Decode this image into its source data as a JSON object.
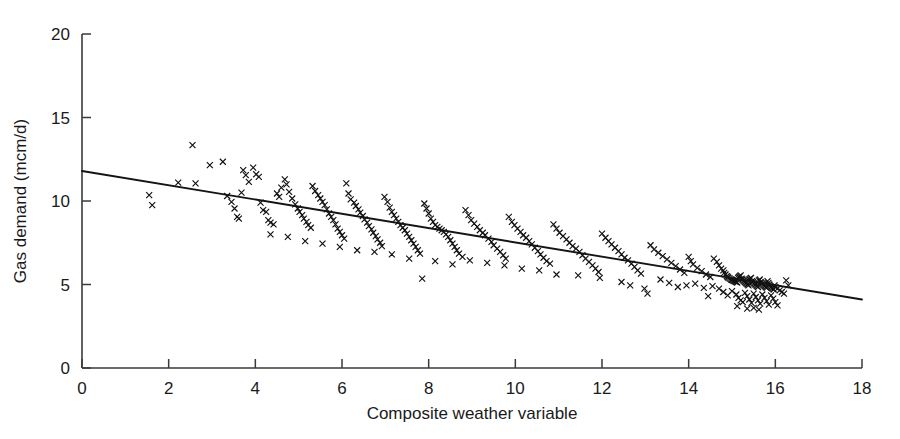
{
  "chart_data": {
    "type": "scatter",
    "title": "",
    "xlabel": "Composite weather variable",
    "ylabel": "Gas demand (mcm/d)",
    "xlim": [
      0,
      18
    ],
    "ylim": [
      0,
      20
    ],
    "xticks": [
      0,
      2,
      4,
      6,
      8,
      10,
      12,
      14,
      16,
      18
    ],
    "yticks": [
      0,
      5,
      10,
      15,
      20
    ],
    "xticklabels": [
      "0",
      "2",
      "4",
      "6",
      "8",
      "10",
      "12",
      "14",
      "16",
      "18"
    ],
    "yticklabels": [
      "0",
      "5",
      "10",
      "15",
      "20"
    ],
    "grid": false,
    "legend": null,
    "marker": "x",
    "marker_color": "#111111",
    "series": [
      {
        "name": "Observations",
        "type": "scatter",
        "points": [
          [
            1.55,
            10.35
          ],
          [
            1.62,
            9.75
          ],
          [
            2.22,
            11.1
          ],
          [
            2.55,
            13.35
          ],
          [
            2.62,
            11.05
          ],
          [
            2.95,
            12.15
          ],
          [
            3.25,
            12.35
          ],
          [
            3.35,
            10.3
          ],
          [
            3.45,
            9.95
          ],
          [
            3.52,
            9.55
          ],
          [
            3.58,
            9.05
          ],
          [
            3.62,
            8.95
          ],
          [
            3.68,
            10.5
          ],
          [
            3.72,
            11.85
          ],
          [
            3.78,
            11.55
          ],
          [
            3.85,
            11.15
          ],
          [
            3.95,
            12.0
          ],
          [
            4.02,
            11.6
          ],
          [
            4.08,
            11.45
          ],
          [
            4.12,
            9.9
          ],
          [
            4.18,
            9.45
          ],
          [
            4.25,
            9.35
          ],
          [
            4.3,
            8.85
          ],
          [
            4.35,
            8.7
          ],
          [
            4.42,
            8.6
          ],
          [
            4.5,
            10.45
          ],
          [
            4.55,
            10.25
          ],
          [
            4.6,
            10.8
          ],
          [
            4.68,
            11.3
          ],
          [
            4.72,
            11.0
          ],
          [
            4.78,
            10.55
          ],
          [
            4.85,
            10.15
          ],
          [
            4.92,
            9.8
          ],
          [
            4.98,
            9.55
          ],
          [
            5.02,
            9.35
          ],
          [
            5.08,
            9.15
          ],
          [
            5.12,
            8.95
          ],
          [
            5.18,
            8.75
          ],
          [
            5.22,
            8.55
          ],
          [
            5.28,
            8.4
          ],
          [
            5.32,
            10.9
          ],
          [
            5.38,
            10.6
          ],
          [
            5.45,
            10.35
          ],
          [
            5.5,
            10.15
          ],
          [
            5.55,
            9.95
          ],
          [
            5.6,
            9.75
          ],
          [
            5.65,
            9.5
          ],
          [
            5.7,
            9.25
          ],
          [
            5.75,
            9.05
          ],
          [
            5.8,
            8.85
          ],
          [
            5.85,
            8.6
          ],
          [
            5.9,
            8.35
          ],
          [
            5.95,
            8.15
          ],
          [
            6.0,
            7.95
          ],
          [
            6.05,
            7.75
          ],
          [
            6.1,
            11.05
          ],
          [
            6.15,
            10.45
          ],
          [
            6.2,
            10.1
          ],
          [
            6.28,
            9.9
          ],
          [
            6.32,
            9.7
          ],
          [
            6.38,
            9.5
          ],
          [
            6.42,
            9.3
          ],
          [
            6.48,
            9.1
          ],
          [
            6.52,
            8.9
          ],
          [
            6.58,
            8.7
          ],
          [
            6.62,
            8.5
          ],
          [
            6.68,
            8.3
          ],
          [
            6.72,
            8.1
          ],
          [
            6.78,
            7.9
          ],
          [
            6.82,
            7.7
          ],
          [
            6.88,
            7.5
          ],
          [
            6.92,
            7.3
          ],
          [
            6.98,
            10.25
          ],
          [
            7.05,
            9.95
          ],
          [
            7.1,
            9.6
          ],
          [
            7.15,
            9.35
          ],
          [
            7.2,
            9.15
          ],
          [
            7.25,
            8.95
          ],
          [
            7.3,
            8.75
          ],
          [
            7.35,
            8.55
          ],
          [
            7.4,
            8.4
          ],
          [
            7.45,
            8.25
          ],
          [
            7.5,
            8.05
          ],
          [
            7.55,
            7.85
          ],
          [
            7.6,
            7.65
          ],
          [
            7.65,
            7.45
          ],
          [
            7.7,
            7.25
          ],
          [
            7.75,
            7.05
          ],
          [
            7.8,
            6.85
          ],
          [
            7.85,
            5.35
          ],
          [
            7.9,
            9.85
          ],
          [
            7.95,
            9.55
          ],
          [
            8.0,
            9.25
          ],
          [
            8.05,
            8.95
          ],
          [
            8.1,
            8.75
          ],
          [
            8.15,
            8.55
          ],
          [
            8.2,
            8.45
          ],
          [
            8.25,
            8.35
          ],
          [
            8.3,
            8.25
          ],
          [
            8.35,
            8.15
          ],
          [
            8.4,
            8.0
          ],
          [
            8.45,
            7.85
          ],
          [
            8.5,
            7.65
          ],
          [
            8.55,
            7.45
          ],
          [
            8.6,
            7.25
          ],
          [
            8.65,
            7.05
          ],
          [
            8.7,
            6.85
          ],
          [
            8.78,
            6.65
          ],
          [
            8.85,
            9.45
          ],
          [
            8.92,
            9.15
          ],
          [
            8.98,
            8.85
          ],
          [
            9.05,
            8.65
          ],
          [
            9.12,
            8.45
          ],
          [
            9.18,
            8.25
          ],
          [
            9.25,
            8.1
          ],
          [
            9.3,
            7.95
          ],
          [
            9.38,
            7.75
          ],
          [
            9.45,
            7.55
          ],
          [
            9.5,
            7.35
          ],
          [
            9.58,
            7.15
          ],
          [
            9.65,
            6.95
          ],
          [
            9.72,
            6.75
          ],
          [
            9.78,
            6.55
          ],
          [
            9.85,
            9.05
          ],
          [
            9.92,
            8.75
          ],
          [
            9.98,
            8.55
          ],
          [
            10.05,
            8.35
          ],
          [
            10.12,
            8.15
          ],
          [
            10.18,
            7.95
          ],
          [
            10.25,
            7.8
          ],
          [
            10.32,
            7.6
          ],
          [
            10.38,
            7.4
          ],
          [
            10.45,
            7.2
          ],
          [
            10.52,
            7.0
          ],
          [
            10.58,
            6.8
          ],
          [
            10.65,
            6.6
          ],
          [
            10.72,
            6.4
          ],
          [
            10.8,
            6.25
          ],
          [
            10.88,
            8.6
          ],
          [
            10.95,
            8.35
          ],
          [
            11.02,
            8.1
          ],
          [
            11.1,
            7.9
          ],
          [
            11.18,
            7.7
          ],
          [
            11.25,
            7.5
          ],
          [
            11.32,
            7.3
          ],
          [
            11.4,
            7.15
          ],
          [
            11.48,
            6.95
          ],
          [
            11.55,
            6.75
          ],
          [
            11.62,
            6.55
          ],
          [
            11.7,
            6.35
          ],
          [
            11.78,
            6.15
          ],
          [
            11.85,
            5.95
          ],
          [
            11.92,
            5.75
          ],
          [
            12.0,
            8.05
          ],
          [
            12.08,
            7.8
          ],
          [
            12.15,
            7.6
          ],
          [
            12.22,
            7.4
          ],
          [
            12.3,
            7.2
          ],
          [
            12.38,
            7.0
          ],
          [
            12.45,
            6.8
          ],
          [
            12.52,
            6.6
          ],
          [
            12.6,
            6.45
          ],
          [
            12.68,
            6.25
          ],
          [
            12.75,
            6.05
          ],
          [
            12.82,
            5.85
          ],
          [
            12.9,
            5.65
          ],
          [
            12.98,
            4.75
          ],
          [
            13.05,
            4.45
          ],
          [
            13.12,
            7.35
          ],
          [
            13.2,
            7.1
          ],
          [
            13.3,
            6.9
          ],
          [
            13.4,
            6.7
          ],
          [
            13.5,
            6.5
          ],
          [
            13.6,
            6.3
          ],
          [
            13.7,
            6.1
          ],
          [
            13.8,
            5.9
          ],
          [
            13.9,
            5.7
          ],
          [
            14.0,
            6.65
          ],
          [
            14.05,
            6.4
          ],
          [
            14.1,
            6.2
          ],
          [
            14.2,
            6.0
          ],
          [
            14.3,
            5.8
          ],
          [
            14.4,
            5.6
          ],
          [
            14.5,
            5.45
          ],
          [
            14.58,
            6.55
          ],
          [
            14.65,
            6.35
          ],
          [
            14.7,
            6.15
          ],
          [
            14.75,
            5.95
          ],
          [
            14.8,
            5.85
          ],
          [
            14.82,
            5.7
          ],
          [
            14.85,
            5.6
          ],
          [
            14.88,
            5.5
          ],
          [
            14.9,
            5.45
          ],
          [
            14.92,
            5.4
          ],
          [
            14.95,
            5.35
          ],
          [
            14.98,
            5.3
          ],
          [
            15.0,
            5.28
          ],
          [
            15.02,
            5.25
          ],
          [
            15.04,
            5.22
          ],
          [
            15.06,
            5.2
          ],
          [
            15.08,
            5.18
          ],
          [
            15.1,
            5.15
          ],
          [
            15.12,
            5.12
          ],
          [
            15.14,
            5.4
          ],
          [
            15.16,
            5.45
          ],
          [
            15.18,
            5.5
          ],
          [
            15.2,
            5.55
          ],
          [
            15.22,
            5.35
          ],
          [
            15.24,
            5.3
          ],
          [
            15.26,
            5.25
          ],
          [
            15.28,
            5.2
          ],
          [
            15.3,
            5.15
          ],
          [
            15.32,
            5.1
          ],
          [
            15.34,
            5.05
          ],
          [
            15.36,
            5.0
          ],
          [
            15.38,
            4.95
          ],
          [
            15.4,
            5.3
          ],
          [
            15.42,
            5.35
          ],
          [
            15.44,
            5.4
          ],
          [
            15.46,
            5.2
          ],
          [
            15.48,
            5.15
          ],
          [
            15.5,
            5.1
          ],
          [
            15.52,
            5.05
          ],
          [
            15.54,
            5.0
          ],
          [
            15.56,
            4.95
          ],
          [
            15.58,
            4.9
          ],
          [
            15.6,
            4.85
          ],
          [
            15.62,
            5.25
          ],
          [
            15.64,
            5.3
          ],
          [
            15.66,
            5.15
          ],
          [
            15.68,
            5.1
          ],
          [
            15.7,
            5.05
          ],
          [
            15.72,
            5.0
          ],
          [
            15.74,
            4.95
          ],
          [
            15.76,
            4.9
          ],
          [
            15.78,
            4.85
          ],
          [
            15.8,
            4.8
          ],
          [
            15.82,
            5.2
          ],
          [
            15.84,
            5.1
          ],
          [
            15.86,
            5.0
          ],
          [
            15.88,
            4.9
          ],
          [
            15.9,
            4.85
          ],
          [
            15.92,
            4.8
          ],
          [
            15.94,
            4.75
          ],
          [
            15.96,
            4.7
          ],
          [
            15.98,
            4.95
          ],
          [
            16.0,
            4.85
          ],
          [
            16.05,
            4.75
          ],
          [
            16.1,
            4.65
          ],
          [
            16.15,
            4.55
          ],
          [
            16.2,
            4.45
          ],
          [
            14.7,
            4.75
          ],
          [
            14.8,
            4.55
          ],
          [
            14.9,
            4.35
          ],
          [
            15.0,
            4.6
          ],
          [
            15.1,
            4.4
          ],
          [
            15.15,
            4.2
          ],
          [
            15.2,
            4.05
          ],
          [
            15.25,
            3.95
          ],
          [
            15.3,
            4.5
          ],
          [
            15.35,
            4.3
          ],
          [
            15.4,
            4.1
          ],
          [
            15.45,
            3.9
          ],
          [
            15.5,
            4.45
          ],
          [
            15.55,
            4.25
          ],
          [
            15.6,
            4.05
          ],
          [
            15.65,
            3.85
          ],
          [
            15.7,
            4.4
          ],
          [
            15.75,
            4.2
          ],
          [
            15.8,
            4.0
          ],
          [
            15.85,
            3.8
          ],
          [
            15.9,
            4.35
          ],
          [
            15.95,
            4.15
          ],
          [
            16.0,
            3.95
          ],
          [
            16.05,
            3.75
          ],
          [
            15.35,
            3.55
          ],
          [
            15.5,
            3.6
          ],
          [
            15.62,
            3.5
          ],
          [
            15.12,
            3.7
          ],
          [
            14.55,
            4.9
          ],
          [
            14.35,
            4.8
          ],
          [
            14.15,
            5.05
          ],
          [
            13.95,
            4.95
          ],
          [
            13.75,
            4.85
          ],
          [
            14.45,
            4.3
          ],
          [
            13.55,
            5.1
          ],
          [
            13.35,
            5.3
          ],
          [
            12.65,
            4.95
          ],
          [
            12.45,
            5.15
          ],
          [
            11.95,
            5.4
          ],
          [
            11.45,
            5.55
          ],
          [
            10.95,
            5.6
          ],
          [
            10.55,
            5.85
          ],
          [
            10.15,
            5.95
          ],
          [
            9.75,
            6.15
          ],
          [
            9.35,
            6.3
          ],
          [
            8.95,
            6.45
          ],
          [
            8.55,
            6.2
          ],
          [
            8.15,
            6.4
          ],
          [
            7.55,
            6.55
          ],
          [
            7.15,
            6.8
          ],
          [
            6.75,
            6.95
          ],
          [
            6.35,
            7.05
          ],
          [
            5.95,
            7.25
          ],
          [
            5.55,
            7.45
          ],
          [
            5.15,
            7.6
          ],
          [
            4.75,
            7.85
          ],
          [
            4.35,
            8.0
          ],
          [
            16.25,
            5.25
          ],
          [
            16.3,
            4.95
          ]
        ]
      },
      {
        "name": "Linear fit",
        "type": "line",
        "points": [
          [
            0,
            11.8
          ],
          [
            18,
            4.1
          ]
        ]
      }
    ]
  }
}
